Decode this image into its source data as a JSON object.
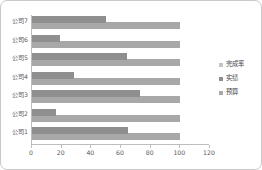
{
  "chart_data": {
    "type": "bar",
    "orientation": "horizontal",
    "title": "",
    "xlabel": "",
    "ylabel": "",
    "categories": [
      "公司1",
      "公司2",
      "公司3",
      "公司4",
      "公司5",
      "公司6",
      "公司7"
    ],
    "series": [
      {
        "name": "完成率",
        "color": "#c4c4c4",
        "values": [
          65,
          16,
          73,
          28,
          64,
          19,
          50
        ]
      },
      {
        "name": "实绩",
        "color": "#8f8f8f",
        "values": [
          65,
          16,
          73,
          28,
          64,
          19,
          50
        ]
      },
      {
        "name": "预算",
        "color": "#a8a8a8",
        "values": [
          100,
          100,
          100,
          100,
          100,
          100,
          100
        ]
      }
    ],
    "xticks": [
      0,
      20,
      40,
      60,
      80,
      100,
      120
    ],
    "xtick_labels": [
      "0",
      "20",
      "40",
      "60",
      "80",
      "100",
      "120"
    ],
    "xlim": [
      0,
      120
    ],
    "grid": false,
    "legend_position": "right"
  },
  "legend": {
    "items": [
      {
        "label": "完成率",
        "color": "#c4c4c4"
      },
      {
        "label": "实绩",
        "color": "#8f8f8f"
      },
      {
        "label": "预算",
        "color": "#a8a8a8"
      }
    ]
  }
}
